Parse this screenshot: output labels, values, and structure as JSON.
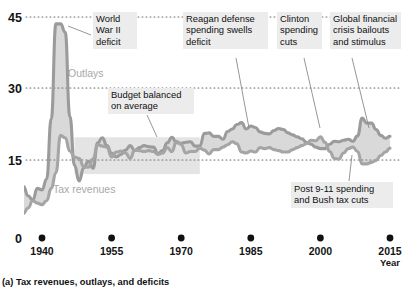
{
  "chart_data": {
    "type": "area",
    "title": "",
    "caption": "(a) Tax revenues, outlays, and deficits",
    "xlabel": "Year",
    "ylabel": "",
    "yunit": "percent of GDP",
    "xlim": [
      1934,
      2016
    ],
    "ylim": [
      0,
      47
    ],
    "yticks": [
      0,
      15,
      30,
      45
    ],
    "ytick_labels": [
      "0",
      "15",
      "30",
      "45"
    ],
    "xticks": [
      1940,
      1955,
      1970,
      1985,
      2000,
      2015
    ],
    "xtick_labels": [
      "1940",
      "1955",
      "1970",
      "1985",
      "2000",
      "2015"
    ],
    "grid": "horizontal-dotted",
    "legend": "inline-labels",
    "colors": {
      "outlays_line": "#9b9b9b",
      "revenues_line": "#a5a5a5",
      "fill": "#d9d9d9",
      "band": "#e4e4e4",
      "callout_bg": "#ececed",
      "text": "#101010",
      "series_label": "#a8a8a8"
    },
    "highlight_band": {
      "label": "Budget balanced on average",
      "x_start": 1947,
      "x_end": 1974,
      "y_start": 13.0,
      "y_end": 20.5
    },
    "series": [
      {
        "name": "Outlays",
        "label_text": "Outlays",
        "x": [
          1934,
          1935,
          1936,
          1937,
          1938,
          1939,
          1940,
          1941,
          1942,
          1943,
          1944,
          1945,
          1946,
          1947,
          1948,
          1949,
          1950,
          1951,
          1952,
          1953,
          1954,
          1955,
          1956,
          1957,
          1958,
          1959,
          1960,
          1961,
          1962,
          1963,
          1964,
          1965,
          1966,
          1967,
          1968,
          1969,
          1970,
          1971,
          1972,
          1973,
          1974,
          1975,
          1976,
          1977,
          1978,
          1979,
          1980,
          1981,
          1982,
          1983,
          1984,
          1985,
          1986,
          1987,
          1988,
          1989,
          1990,
          1991,
          1992,
          1993,
          1994,
          1995,
          1996,
          1997,
          1998,
          1999,
          2000,
          2001,
          2002,
          2003,
          2004,
          2005,
          2006,
          2007,
          2008,
          2009,
          2010,
          2011,
          2012,
          2013,
          2014,
          2015
        ],
        "values": [
          10.7,
          9.2,
          10.5,
          8.6,
          7.7,
          10.1,
          9.8,
          12.0,
          24.3,
          43.6,
          43.6,
          41.9,
          24.8,
          14.8,
          11.6,
          14.3,
          15.6,
          14.2,
          19.4,
          20.4,
          18.8,
          17.3,
          16.5,
          17.0,
          17.9,
          18.8,
          17.8,
          18.4,
          18.8,
          18.6,
          18.5,
          17.2,
          17.8,
          19.4,
          20.5,
          19.4,
          19.3,
          19.5,
          19.6,
          18.7,
          18.7,
          21.3,
          21.4,
          20.7,
          20.7,
          20.1,
          21.7,
          22.2,
          23.1,
          23.5,
          22.2,
          22.8,
          22.5,
          21.6,
          21.3,
          21.2,
          21.9,
          22.3,
          22.1,
          21.4,
          21.0,
          20.6,
          20.2,
          19.5,
          19.1,
          18.5,
          18.2,
          18.2,
          19.1,
          19.7,
          19.6,
          19.9,
          20.1,
          19.7,
          20.8,
          24.4,
          23.4,
          23.4,
          22.1,
          20.9,
          20.3,
          20.7
        ]
      },
      {
        "name": "Tax revenues",
        "label_text": "Tax revenues",
        "x": [
          1934,
          1935,
          1936,
          1937,
          1938,
          1939,
          1940,
          1941,
          1942,
          1943,
          1944,
          1945,
          1946,
          1947,
          1948,
          1949,
          1950,
          1951,
          1952,
          1953,
          1954,
          1955,
          1956,
          1957,
          1958,
          1959,
          1960,
          1961,
          1962,
          1963,
          1964,
          1965,
          1966,
          1967,
          1968,
          1969,
          1970,
          1971,
          1972,
          1973,
          1974,
          1975,
          1976,
          1977,
          1978,
          1979,
          1980,
          1981,
          1982,
          1983,
          1984,
          1985,
          1986,
          1987,
          1988,
          1989,
          1990,
          1991,
          1992,
          1993,
          1994,
          1995,
          1996,
          1997,
          1998,
          1999,
          2000,
          2001,
          2002,
          2003,
          2004,
          2005,
          2006,
          2007,
          2008,
          2009,
          2010,
          2011,
          2012,
          2013,
          2014,
          2015
        ],
        "values": [
          4.8,
          5.2,
          5.0,
          6.1,
          7.6,
          7.1,
          6.8,
          7.6,
          10.1,
          13.3,
          20.9,
          20.4,
          17.7,
          16.5,
          16.2,
          14.5,
          14.4,
          16.1,
          19.0,
          18.7,
          18.5,
          16.5,
          17.5,
          17.7,
          17.3,
          16.2,
          17.9,
          17.8,
          17.6,
          17.8,
          17.6,
          17.0,
          17.3,
          18.4,
          17.6,
          19.7,
          19.0,
          17.3,
          17.6,
          17.6,
          18.3,
          17.9,
          17.1,
          18.0,
          18.0,
          18.5,
          19.0,
          19.6,
          19.2,
          17.5,
          17.3,
          17.7,
          17.5,
          18.4,
          18.2,
          18.4,
          18.0,
          17.8,
          17.5,
          17.5,
          18.0,
          18.4,
          18.8,
          19.2,
          19.9,
          19.8,
          20.6,
          19.5,
          17.6,
          16.2,
          16.1,
          17.3,
          18.2,
          18.5,
          17.6,
          15.1,
          15.1,
          15.4,
          15.8,
          16.8,
          17.5,
          18.3
        ]
      }
    ],
    "annotations": [
      {
        "id": "wwii",
        "text": "World\nWar II\ndeficit",
        "anchor_year": 1943,
        "anchor_value": 40.0
      },
      {
        "id": "reagan",
        "text": "Reagan defense\nspending swells\ndeficit",
        "anchor_year": 1983,
        "anchor_value": 23.0
      },
      {
        "id": "clinton",
        "text": "Clinton\nspending\ncuts",
        "anchor_year": 1999,
        "anchor_value": 19.0
      },
      {
        "id": "gfc",
        "text": "Global financial\ncrisis bailouts\nand stimulus",
        "anchor_year": 2009,
        "anchor_value": 24.4
      },
      {
        "id": "post911",
        "text": "Post 9-11 spending\nand Bush tax cuts",
        "anchor_year": 2004,
        "anchor_value": 16.1
      },
      {
        "id": "balanced",
        "text": "Budget balanced\non average",
        "anchor_year": 1961,
        "anchor_value": 18.0
      }
    ]
  },
  "axis": {
    "x_title": "Year"
  }
}
